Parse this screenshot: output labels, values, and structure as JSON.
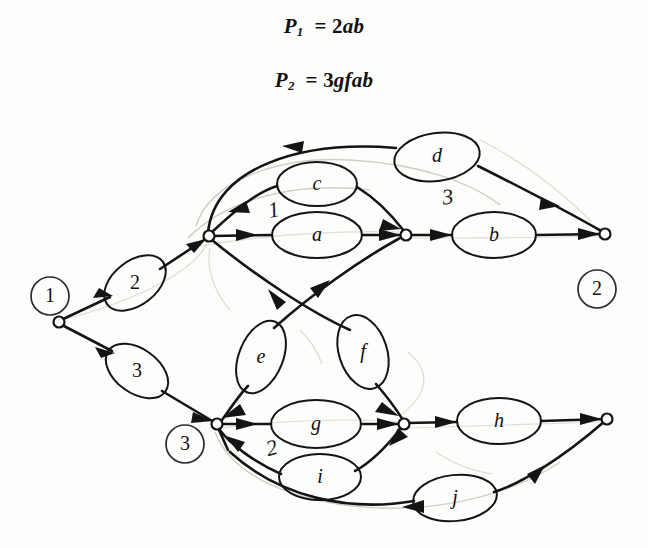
{
  "figure": {
    "kind": "hand-drawn signal flow graph",
    "background_color": "#fdfdfb",
    "ink_color": "#141414"
  },
  "equations": [
    {
      "id": "eq1",
      "lhs": "P",
      "sub": "1",
      "eq": "=",
      "rhs": "2ab",
      "text": "P₁ = 2ab"
    },
    {
      "id": "eq2",
      "lhs": "P",
      "sub": "2",
      "eq": "=",
      "rhs": "3gfab",
      "text": "P₂ = 3gfab"
    }
  ],
  "circled_labels": [
    {
      "name": "node-label-1",
      "text": "1",
      "x": 50,
      "y": 296
    },
    {
      "name": "node-label-2",
      "text": "2",
      "x": 597,
      "y": 289
    },
    {
      "name": "node-label-3",
      "text": "3",
      "x": 185,
      "y": 444
    }
  ],
  "nodes": [
    {
      "name": "source-node",
      "id": "n1",
      "x": 59,
      "y": 322
    },
    {
      "name": "hub-node-upper-left",
      "id": "u1",
      "x": 209,
      "y": 236
    },
    {
      "name": "hub-node-upper-right",
      "id": "u2",
      "x": 406,
      "y": 235
    },
    {
      "name": "sink-node-right",
      "id": "n2",
      "x": 605,
      "y": 234
    },
    {
      "name": "hub-node-lower-left",
      "id": "l1",
      "x": 217,
      "y": 424
    },
    {
      "name": "hub-node-lower-right",
      "id": "l2",
      "x": 404,
      "y": 424
    },
    {
      "name": "sink-node-lower-right",
      "id": "n3",
      "x": 607,
      "y": 419
    }
  ],
  "branch_ellipses": [
    {
      "name": "branch-2",
      "label": "2",
      "style": "upright-number",
      "cx": 135,
      "cy": 283,
      "rx": 35,
      "ry": 22,
      "rot": -38
    },
    {
      "name": "branch-3",
      "label": "3",
      "style": "upright-number",
      "cx": 137,
      "cy": 371,
      "rx": 35,
      "ry": 22,
      "rot": 36
    },
    {
      "name": "branch-c",
      "label": "c",
      "style": "italic",
      "cx": 317,
      "cy": 184,
      "rx": 40,
      "ry": 22,
      "rot": 0
    },
    {
      "name": "branch-a",
      "label": "a",
      "style": "italic",
      "cx": 317,
      "cy": 235,
      "rx": 45,
      "ry": 23,
      "rot": 0
    },
    {
      "name": "branch-d",
      "label": "d",
      "style": "italic",
      "cx": 437,
      "cy": 157,
      "rx": 43,
      "ry": 24,
      "rot": -8
    },
    {
      "name": "branch-b",
      "label": "b",
      "style": "italic",
      "cx": 494,
      "cy": 235,
      "rx": 42,
      "ry": 23,
      "rot": 0
    },
    {
      "name": "branch-e",
      "label": "e",
      "style": "italic",
      "cx": 261,
      "cy": 357,
      "rx": 22,
      "ry": 38,
      "rot": 22
    },
    {
      "name": "branch-f",
      "label": "f",
      "style": "italic",
      "cx": 363,
      "cy": 352,
      "rx": 24,
      "ry": 38,
      "rot": -18
    },
    {
      "name": "branch-g",
      "label": "g",
      "style": "italic",
      "cx": 316,
      "cy": 424,
      "rx": 45,
      "ry": 24,
      "rot": 0
    },
    {
      "name": "branch-i",
      "label": "i",
      "style": "italic",
      "cx": 320,
      "cy": 477,
      "rx": 41,
      "ry": 23,
      "rot": 0
    },
    {
      "name": "branch-h",
      "label": "h",
      "style": "italic",
      "cx": 499,
      "cy": 421,
      "rx": 42,
      "ry": 23,
      "rot": 0
    },
    {
      "name": "branch-j",
      "label": "j",
      "style": "italic",
      "cx": 455,
      "cy": 498,
      "rx": 42,
      "ry": 23,
      "rot": -6
    }
  ],
  "hand_annotations": [
    {
      "name": "annotation-1",
      "text": "1",
      "x": 274,
      "y": 212
    },
    {
      "name": "annotation-3",
      "text": "3",
      "x": 448,
      "y": 199
    },
    {
      "name": "annotation-2",
      "text": "2",
      "x": 272,
      "y": 450
    }
  ]
}
